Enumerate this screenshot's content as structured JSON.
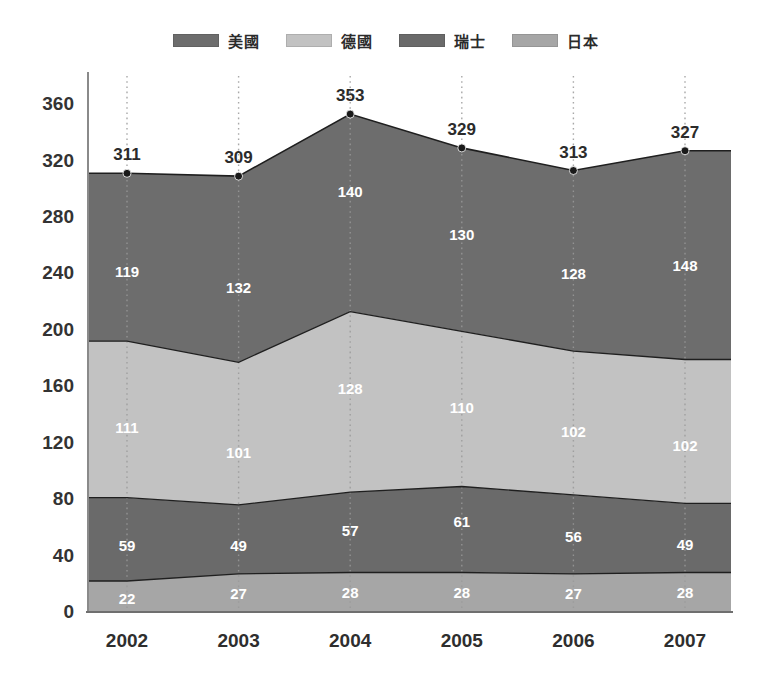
{
  "legend": {
    "position": "top-center",
    "items": [
      {
        "label": "美國",
        "color": "#6d6d6d"
      },
      {
        "label": "德國",
        "color": "#c2c2c2"
      },
      {
        "label": "瑞士",
        "color": "#6a6a6a"
      },
      {
        "label": "日本",
        "color": "#a6a6a6"
      }
    ]
  },
  "axis": {
    "y_ticks": [
      "0",
      "40",
      "80",
      "120",
      "160",
      "200",
      "240",
      "280",
      "320",
      "360"
    ],
    "x_ticks": [
      "2002",
      "2003",
      "2004",
      "2005",
      "2006",
      "2007"
    ]
  },
  "totals": [
    "311",
    "309",
    "353",
    "329",
    "313",
    "327"
  ],
  "labels": {
    "usa": [
      "119",
      "132",
      "140",
      "130",
      "128",
      "148"
    ],
    "germany": [
      "111",
      "101",
      "128",
      "110",
      "102",
      "102"
    ],
    "switzerland": [
      "59",
      "49",
      "57",
      "61",
      "56",
      "49"
    ],
    "japan": [
      "22",
      "27",
      "28",
      "28",
      "27",
      "28"
    ]
  },
  "chart_data": {
    "type": "area",
    "stacked": true,
    "title": "",
    "xlabel": "",
    "ylabel": "",
    "categories": [
      2002,
      2003,
      2004,
      2005,
      2006,
      2007
    ],
    "ylim": [
      0,
      380
    ],
    "ytick_step": 40,
    "grid": "vertical-dotted",
    "legend_position": "top-center",
    "series": [
      {
        "name": "日本",
        "color": "#a6a6a6",
        "stack_order": 1,
        "values": [
          22,
          27,
          28,
          28,
          27,
          28
        ]
      },
      {
        "name": "瑞士",
        "color": "#6a6a6a",
        "stack_order": 2,
        "values": [
          59,
          49,
          57,
          61,
          56,
          49
        ]
      },
      {
        "name": "德國",
        "color": "#c2c2c2",
        "stack_order": 3,
        "values": [
          111,
          101,
          128,
          110,
          102,
          102
        ]
      },
      {
        "name": "美國",
        "color": "#6d6d6d",
        "stack_order": 4,
        "values": [
          119,
          132,
          140,
          130,
          128,
          148
        ]
      }
    ],
    "totals": [
      311,
      309,
      353,
      329,
      313,
      327
    ],
    "annotations": [
      {
        "x": 2002,
        "y": 311,
        "text": "311"
      },
      {
        "x": 2003,
        "y": 309,
        "text": "309"
      },
      {
        "x": 2004,
        "y": 353,
        "text": "353"
      },
      {
        "x": 2005,
        "y": 329,
        "text": "329"
      },
      {
        "x": 2006,
        "y": 313,
        "text": "313"
      },
      {
        "x": 2007,
        "y": 327,
        "text": "327"
      }
    ]
  },
  "colors": {
    "usa": "#6d6d6d",
    "germany": "#c2c2c2",
    "switzerland": "#6a6a6a",
    "japan": "#a6a6a6",
    "axis": "#8a8a8a",
    "grid": "#9a9a9a",
    "marker": "#1a1a1a",
    "boundary": "#1f1f1f"
  }
}
